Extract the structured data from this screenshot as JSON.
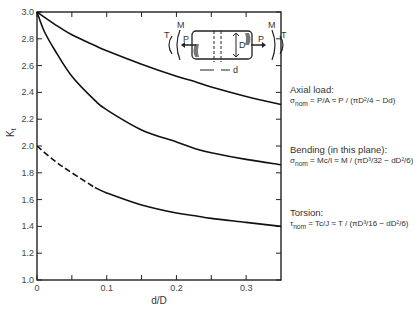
{
  "chart_data": {
    "type": "line",
    "title": "",
    "xlabel": "d/D",
    "ylabel": "Kt",
    "xlim": [
      0,
      0.35
    ],
    "ylim": [
      1.0,
      3.0
    ],
    "x_ticks": [
      "0",
      "0.1",
      "0.2",
      "0.3"
    ],
    "x_minor_ticks": [
      0.05,
      0.15,
      0.25
    ],
    "y_ticks": [
      "1.0",
      "1.2",
      "1.4",
      "1.6",
      "1.8",
      "2.0",
      "2.2",
      "2.4",
      "2.6",
      "2.8",
      "3.0"
    ],
    "grid": false,
    "series": [
      {
        "name": "Axial load",
        "x": [
          0,
          0.025,
          0.05,
          0.083,
          0.1,
          0.15,
          0.2,
          0.227,
          0.25,
          0.3,
          0.35
        ],
        "values": [
          3.0,
          2.91,
          2.83,
          2.75,
          2.71,
          2.61,
          2.52,
          2.48,
          2.44,
          2.37,
          2.31
        ],
        "style": "solid"
      },
      {
        "name": "Bending (in this plane)",
        "x": [
          0,
          0.01,
          0.025,
          0.05,
          0.083,
          0.1,
          0.15,
          0.2,
          0.227,
          0.25,
          0.3,
          0.35
        ],
        "values": [
          3.0,
          2.86,
          2.72,
          2.52,
          2.34,
          2.27,
          2.12,
          2.03,
          1.98,
          1.95,
          1.9,
          1.86
        ],
        "style": "solid"
      },
      {
        "name": "Torsion",
        "x": [
          0,
          0.025,
          0.05,
          0.083,
          0.1,
          0.15,
          0.2,
          0.227,
          0.25,
          0.3,
          0.35
        ],
        "values": [
          2.0,
          1.89,
          1.8,
          1.69,
          1.65,
          1.56,
          1.5,
          1.48,
          1.46,
          1.43,
          1.4
        ],
        "style": "dashed until 0.09, solid after",
        "dashed_until": 0.09
      }
    ],
    "annotations": [
      {
        "title": "Axial load:",
        "formula": "σnom = P/A ≈ P / (πD²/4 − Dd)"
      },
      {
        "title": "Bending (in this plane):",
        "formula": "σnom = Mc/I ≈ M / (πD³/32 − dD²/6)"
      },
      {
        "title": "Torsion:",
        "formula": "τnom = Tc/J ≈ T / (πD³/16 − dD²/6)"
      }
    ],
    "inset_labels": [
      "T",
      "M",
      "P",
      "D",
      "d",
      "P",
      "M",
      "T"
    ]
  },
  "notes": {
    "axial": {
      "title": "Axial load:",
      "lhs": "σ",
      "sub": "nom",
      "eq": " = P/A ≈ P / (πD²/4 − Dd)"
    },
    "bending": {
      "title": "Bending (in this plane):",
      "lhs": "σ",
      "sub": "nom",
      "eq": " = Mc/I ≈ M / (πD³/32 − dD²/6)"
    },
    "torsion": {
      "title": "Torsion:",
      "lhs": "τ",
      "sub": "nom",
      "eq": " = Tc/J ≈ T / (πD³/16 − dD²/6)"
    }
  },
  "inset": {
    "t_left": "T",
    "m_left": "M",
    "p_left": "P",
    "d_big": "D",
    "d_small": "d",
    "p_right": "P",
    "m_right": "M",
    "t_right": "T"
  },
  "axes": {
    "xlabel": "d/D",
    "ylabel": "K",
    "ylabel_sub": "t"
  }
}
